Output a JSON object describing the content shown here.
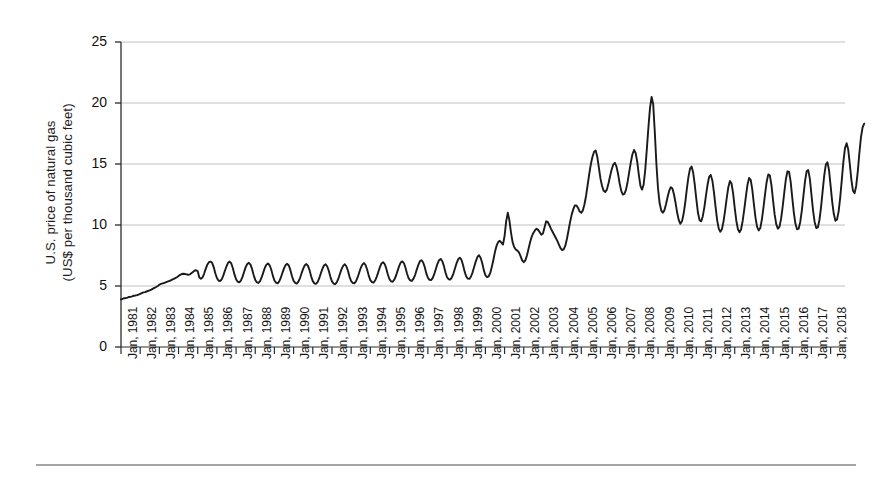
{
  "chart_data": {
    "type": "line",
    "title": "",
    "xlabel": "",
    "ylabel": "U.S. price of natural gas\n(US$ per thousand cubic feet)",
    "ylabel_line1": "U.S. price of natural gas",
    "ylabel_line2": "(US$ per thousand cubic feet)",
    "ylim": [
      0,
      25
    ],
    "ytick_labels": [
      "0",
      "5",
      "10",
      "15",
      "20",
      "25"
    ],
    "ytick_values": [
      0,
      5,
      10,
      15,
      20,
      25
    ],
    "grid": true,
    "grid_color": "#b9b9b9",
    "line_color": "#1a1a1a",
    "legend": "none",
    "xtick_labels": [
      "Jan, 1981",
      "Jan, 1982",
      "Jan, 1983",
      "Jan, 1984",
      "Jan, 1985",
      "Jan, 1986",
      "Jan, 1987",
      "Jan, 1988",
      "Jan, 1989",
      "Jan, 1990",
      "Jan, 1991",
      "Jan, 1992",
      "Jan, 1993",
      "Jan, 1994",
      "Jan, 1995",
      "Jan, 1996",
      "Jan, 1997",
      "Jan, 1998",
      "Jan, 1999",
      "Jan, 2000",
      "Jan, 2001",
      "Jan, 2002",
      "Jan, 2003",
      "Jan, 2004",
      "Jan, 2005",
      "Jan, 2006",
      "Jan, 2007",
      "Jan, 2008",
      "Jan, 2009",
      "Jan, 2010",
      "Jan, 2011",
      "Jan, 2012",
      "Jan, 2013",
      "Jan, 2014",
      "Jan, 2015",
      "Jan, 2016",
      "Jan, 2017",
      "Jan, 2018"
    ],
    "x_start_year": 1981,
    "x_end_year": 2018.75,
    "x_unit": "month",
    "series": [
      {
        "name": "U.S. price of natural gas (US$ per thousand cubic feet)",
        "values": [
          3.9,
          3.95,
          4.0,
          4.02,
          4.05,
          4.1,
          4.12,
          4.15,
          4.2,
          4.22,
          4.25,
          4.3,
          4.35,
          4.42,
          4.48,
          4.5,
          4.55,
          4.6,
          4.65,
          4.7,
          4.78,
          4.85,
          4.92,
          5.0,
          5.1,
          5.18,
          5.22,
          5.25,
          5.3,
          5.35,
          5.4,
          5.45,
          5.52,
          5.58,
          5.65,
          5.72,
          5.82,
          5.92,
          5.98,
          6.0,
          5.98,
          5.95,
          5.92,
          5.95,
          6.05,
          6.15,
          6.25,
          6.3,
          6.2,
          5.7,
          5.6,
          5.7,
          6.0,
          6.4,
          6.75,
          6.95,
          7.0,
          6.9,
          6.55,
          6.05,
          5.65,
          5.45,
          5.4,
          5.55,
          5.85,
          6.25,
          6.6,
          6.9,
          7.0,
          6.85,
          6.45,
          5.95,
          5.55,
          5.35,
          5.3,
          5.45,
          5.75,
          6.15,
          6.55,
          6.8,
          6.9,
          6.75,
          6.4,
          5.9,
          5.5,
          5.3,
          5.25,
          5.4,
          5.7,
          6.1,
          6.5,
          6.75,
          6.85,
          6.7,
          6.35,
          5.85,
          5.45,
          5.28,
          5.22,
          5.38,
          5.68,
          6.08,
          6.45,
          6.72,
          6.82,
          6.68,
          6.3,
          5.8,
          5.42,
          5.25,
          5.2,
          5.35,
          5.65,
          6.05,
          6.42,
          6.7,
          6.8,
          6.65,
          6.28,
          5.78,
          5.4,
          5.22,
          5.18,
          5.32,
          5.62,
          6.02,
          6.4,
          6.68,
          6.78,
          6.62,
          6.25,
          5.75,
          5.38,
          5.2,
          5.15,
          5.3,
          5.6,
          6.0,
          6.38,
          6.65,
          6.78,
          6.62,
          6.25,
          5.75,
          5.4,
          5.25,
          5.22,
          5.38,
          5.68,
          6.08,
          6.48,
          6.75,
          6.88,
          6.72,
          6.35,
          5.85,
          5.48,
          5.32,
          5.28,
          5.45,
          5.75,
          6.15,
          6.55,
          6.85,
          6.95,
          6.8,
          6.42,
          5.92,
          5.55,
          5.38,
          5.35,
          5.52,
          5.82,
          6.22,
          6.62,
          6.92,
          7.02,
          6.88,
          6.5,
          6.0,
          5.62,
          5.45,
          5.42,
          5.6,
          5.9,
          6.32,
          6.72,
          7.02,
          7.12,
          6.95,
          6.58,
          6.05,
          5.68,
          5.5,
          5.48,
          5.65,
          5.98,
          6.4,
          6.82,
          7.12,
          7.22,
          7.05,
          6.65,
          6.12,
          5.72,
          5.55,
          5.52,
          5.7,
          6.02,
          6.45,
          6.88,
          7.2,
          7.32,
          7.15,
          6.72,
          6.18,
          5.78,
          5.6,
          5.58,
          5.78,
          6.12,
          6.58,
          7.02,
          7.38,
          7.52,
          7.32,
          6.88,
          6.3,
          5.88,
          5.72,
          5.78,
          6.05,
          6.55,
          7.15,
          7.8,
          8.3,
          8.6,
          8.7,
          8.55,
          8.4,
          9.1,
          10.3,
          11.0,
          10.4,
          9.4,
          8.6,
          8.2,
          8.0,
          7.9,
          7.75,
          7.45,
          7.1,
          6.95,
          7.1,
          7.5,
          8.05,
          8.6,
          9.05,
          9.35,
          9.55,
          9.7,
          9.6,
          9.4,
          9.2,
          9.3,
          9.8,
          10.3,
          10.25,
          10.0,
          9.7,
          9.45,
          9.2,
          8.95,
          8.7,
          8.4,
          8.1,
          7.95,
          8.0,
          8.3,
          8.85,
          9.55,
          10.25,
          10.85,
          11.3,
          11.6,
          11.6,
          11.4,
          11.1,
          11.0,
          11.2,
          11.7,
          12.4,
          13.3,
          14.2,
          15.0,
          15.6,
          16.0,
          16.1,
          15.6,
          14.7,
          13.8,
          13.2,
          12.8,
          12.7,
          12.9,
          13.4,
          14.0,
          14.55,
          14.95,
          15.1,
          14.8,
          14.2,
          13.4,
          12.8,
          12.5,
          12.55,
          12.9,
          13.55,
          14.35,
          15.15,
          15.8,
          16.15,
          15.9,
          15.2,
          14.1,
          13.2,
          12.9,
          13.3,
          14.5,
          16.2,
          18.0,
          19.6,
          20.5,
          19.9,
          17.6,
          15.0,
          13.0,
          11.8,
          11.2,
          11.0,
          11.2,
          11.7,
          12.3,
          12.8,
          13.1,
          13.0,
          12.5,
          11.8,
          11.0,
          10.4,
          10.1,
          10.3,
          10.9,
          11.8,
          12.9,
          13.9,
          14.6,
          14.8,
          14.3,
          13.3,
          12.1,
          11.0,
          10.4,
          10.3,
          10.7,
          11.45,
          12.4,
          13.3,
          13.95,
          14.1,
          13.65,
          12.7,
          11.5,
          10.4,
          9.7,
          9.45,
          9.65,
          10.3,
          11.2,
          12.2,
          13.1,
          13.6,
          13.4,
          12.6,
          11.4,
          10.35,
          9.65,
          9.4,
          9.65,
          10.35,
          11.3,
          12.35,
          13.3,
          13.85,
          13.7,
          12.9,
          11.7,
          10.6,
          9.85,
          9.55,
          9.75,
          10.45,
          11.45,
          12.55,
          13.55,
          14.15,
          14.05,
          13.25,
          12.0,
          10.85,
          10.05,
          9.7,
          9.85,
          10.5,
          11.5,
          12.65,
          13.75,
          14.4,
          14.35,
          13.55,
          12.25,
          11.0,
          10.1,
          9.65,
          9.7,
          10.25,
          11.2,
          12.4,
          13.6,
          14.4,
          14.5,
          13.8,
          12.5,
          11.2,
          10.25,
          9.75,
          9.8,
          10.4,
          11.45,
          12.75,
          14.05,
          14.95,
          15.15,
          14.5,
          13.2,
          11.9,
          10.9,
          10.35,
          10.45,
          11.1,
          12.25,
          13.7,
          15.2,
          16.3,
          16.7,
          16.2,
          15.0,
          13.7,
          12.8,
          12.6,
          13.2,
          14.4,
          15.9,
          17.2,
          18.0,
          18.3
        ]
      }
    ]
  }
}
